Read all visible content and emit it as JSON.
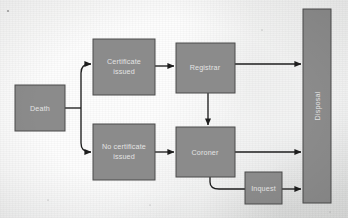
{
  "diagram": {
    "type": "flowchart",
    "canvas": {
      "width": 348,
      "height": 218
    },
    "style": {
      "node_fill": "#8b8b8b",
      "node_border": "#4a4a4a",
      "node_text": "#e3e3e3",
      "edge_color": "#1e1e1e",
      "background": "#e9eaea"
    },
    "nodes": [
      {
        "id": "death",
        "label": "Death",
        "lines": [
          "Death"
        ],
        "shape": "rect",
        "x": 15,
        "y": 85,
        "w": 50,
        "h": 46,
        "orientation": "horizontal"
      },
      {
        "id": "cert_issued",
        "label": "Certificate issued",
        "lines": [
          "Certificate",
          "issued"
        ],
        "shape": "rect",
        "x": 93,
        "y": 39,
        "w": 62,
        "h": 56,
        "orientation": "horizontal"
      },
      {
        "id": "no_cert_issued",
        "label": "No certificate issued",
        "lines": [
          "No certificate",
          "issued"
        ],
        "shape": "rect",
        "x": 93,
        "y": 124,
        "w": 62,
        "h": 56,
        "orientation": "horizontal"
      },
      {
        "id": "registrar",
        "label": "Registrar",
        "lines": [
          "Registrar"
        ],
        "shape": "rect",
        "x": 176,
        "y": 43,
        "w": 59,
        "h": 50,
        "orientation": "horizontal"
      },
      {
        "id": "coroner",
        "label": "Coroner",
        "lines": [
          "Coroner"
        ],
        "shape": "rect",
        "x": 176,
        "y": 127,
        "w": 59,
        "h": 50,
        "orientation": "horizontal"
      },
      {
        "id": "inquest",
        "label": "Inquest",
        "lines": [
          "Inquest"
        ],
        "shape": "rect",
        "x": 245,
        "y": 172,
        "w": 37,
        "h": 32,
        "orientation": "horizontal"
      },
      {
        "id": "disposal",
        "label": "Disposal",
        "lines": [
          "Disposal"
        ],
        "shape": "bar",
        "x": 303,
        "y": 9,
        "w": 28,
        "h": 194,
        "orientation": "vertical-bottom-up"
      }
    ],
    "edges": [
      {
        "from": "death",
        "to": "cert_issued",
        "style": "branch-up",
        "arrow": true
      },
      {
        "from": "death",
        "to": "no_cert_issued",
        "style": "branch-down",
        "arrow": true
      },
      {
        "from": "cert_issued",
        "to": "registrar",
        "style": "straight",
        "arrow": true
      },
      {
        "from": "no_cert_issued",
        "to": "coroner",
        "style": "straight",
        "arrow": true
      },
      {
        "from": "registrar",
        "to": "coroner",
        "style": "vertical-down",
        "arrow": true
      },
      {
        "from": "registrar",
        "to": "disposal",
        "style": "straight",
        "arrow": true
      },
      {
        "from": "coroner",
        "to": "disposal",
        "style": "straight",
        "arrow": true
      },
      {
        "from": "coroner",
        "to": "inquest",
        "style": "elbow-curve",
        "arrow": false
      },
      {
        "from": "inquest",
        "to": "disposal",
        "style": "straight",
        "arrow": true
      }
    ]
  }
}
